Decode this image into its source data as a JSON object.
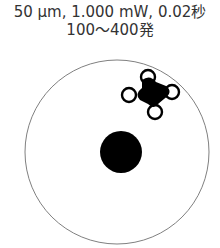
{
  "title": {
    "line1": "50 μm, 1.000 mW, 0.02秒",
    "line2": "100〜400発"
  },
  "diagram": {
    "outer_circle": {
      "cx": 117,
      "cy": 152,
      "r": 92,
      "stroke": "#808080"
    },
    "center_spot": {
      "cx": 121,
      "cy": 152,
      "r": 21,
      "fill": "#000000"
    },
    "cluster_blob": {
      "cx": 151,
      "cy": 93
    },
    "rings": [
      {
        "cx": 148,
        "cy": 77,
        "r": 7
      },
      {
        "cx": 129,
        "cy": 95,
        "r": 7
      },
      {
        "cx": 172,
        "cy": 92,
        "r": 7
      },
      {
        "cx": 155,
        "cy": 112,
        "r": 7
      }
    ]
  }
}
